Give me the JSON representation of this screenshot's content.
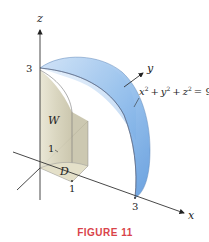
{
  "figure": {
    "caption": "FIGURE 11",
    "caption_color": "#d9434a",
    "surface_color": "#7fb2e8",
    "cylinder_color": "#dedbc8"
  },
  "axes": {
    "x_label": "x",
    "y_label": "y",
    "z_label": "z"
  },
  "ticks": {
    "z_3": "3",
    "x_3": "3",
    "x_1": "1",
    "y_1": "1"
  },
  "regions": {
    "solid_label": "W",
    "domain_label": "D"
  },
  "equation": {
    "lhs_x": "x",
    "lhs_y": "y",
    "lhs_z": "z",
    "exp": "2",
    "plus": "+",
    "rhs": "= 9"
  }
}
